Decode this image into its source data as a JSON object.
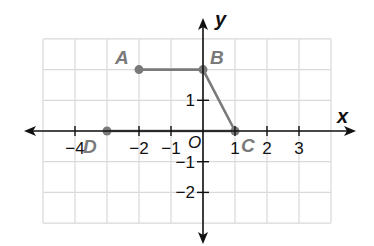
{
  "graph": {
    "origin_px": [
      203,
      131
    ],
    "unit_px": [
      32,
      30.7
    ],
    "grid": {
      "x_min": -5,
      "x_max": 4,
      "y_min": -3,
      "y_max": 3,
      "color": "#d9d9d9"
    },
    "axes": {
      "x_label": "x",
      "y_label": "y",
      "origin_label": "O",
      "color": "#111111"
    },
    "x_ticks": [
      {
        "value": -4,
        "label": "−4"
      },
      {
        "value": -2,
        "label": "−2"
      },
      {
        "value": -1,
        "label": "−1"
      },
      {
        "value": 1,
        "label": "1"
      },
      {
        "value": 2,
        "label": "2"
      },
      {
        "value": 3,
        "label": "3"
      }
    ],
    "y_ticks": [
      {
        "value": 1,
        "label": "1"
      },
      {
        "value": -1,
        "label": "−1"
      },
      {
        "value": -2,
        "label": "−2"
      }
    ],
    "shape": {
      "type": "trapezoid",
      "color": "#7a7a7a",
      "vertices": [
        {
          "name": "A",
          "x": -2,
          "y": 2
        },
        {
          "name": "B",
          "x": 0,
          "y": 2
        },
        {
          "name": "C",
          "x": 1,
          "y": 0
        },
        {
          "name": "D",
          "x": -3,
          "y": 0
        }
      ]
    }
  }
}
